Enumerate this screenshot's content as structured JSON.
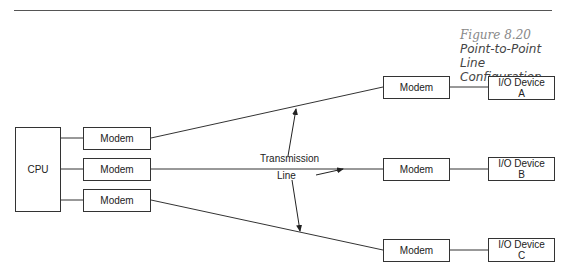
{
  "figure": {
    "number": "Figure 8.20",
    "title_line1": "Point-to-Point Line",
    "title_line2": "Configuration"
  },
  "nodes": {
    "cpu": "CPU",
    "host_modems": [
      "Modem",
      "Modem",
      "Modem"
    ],
    "remote_modems": [
      "Modem",
      "Modem",
      "Modem"
    ],
    "io_devices": [
      {
        "line1": "I/O Device",
        "line2": "A"
      },
      {
        "line1": "I/O Device",
        "line2": "B"
      },
      {
        "line1": "I/O Device",
        "line2": "C"
      }
    ]
  },
  "annotation": {
    "line1": "Transmission",
    "line2": "Line"
  },
  "colors": {
    "stroke": "#333333",
    "caption_number": "#888888",
    "caption_title": "#444444"
  }
}
